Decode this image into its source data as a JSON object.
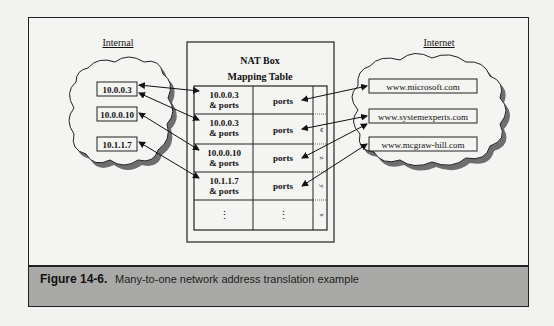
{
  "figure": {
    "label": "Figure 14-6.",
    "caption": "Many-to-one network address translation example"
  },
  "internal": {
    "title": "Internal",
    "hosts": [
      "10.0.0.3",
      "10.0.0.10",
      "10.1.1.7"
    ]
  },
  "internet": {
    "title": "Internet",
    "hosts": [
      "www.microsoft.com",
      "www.systemexperts.com",
      "www.mcgraw-hill.com"
    ]
  },
  "nat_box": {
    "title_line1": "NAT Box",
    "title_line2": "Mapping Table",
    "rows": [
      {
        "internal_line1": "10.0.0.3",
        "internal_line2": "& ports",
        "external": "ports",
        "letter": ""
      },
      {
        "internal_line1": "10.0.0.3",
        "internal_line2": "& ports",
        "external": "ports",
        "letter": "w"
      },
      {
        "internal_line1": "10.0.0.10",
        "internal_line2": "& ports",
        "external": "ports",
        "letter": "z"
      },
      {
        "internal_line1": "10.1.1.7",
        "internal_line2": "& ports",
        "external": "ports",
        "letter": "y"
      },
      {
        "internal_line1": "⋮",
        "internal_line2": "",
        "external": "⋮",
        "letter": "x"
      }
    ]
  },
  "colors": {
    "background": "#f2f2f0",
    "caption_band": "#a9a9a7",
    "cloud_shadow": "#6e6e6e",
    "line": "#222222"
  }
}
